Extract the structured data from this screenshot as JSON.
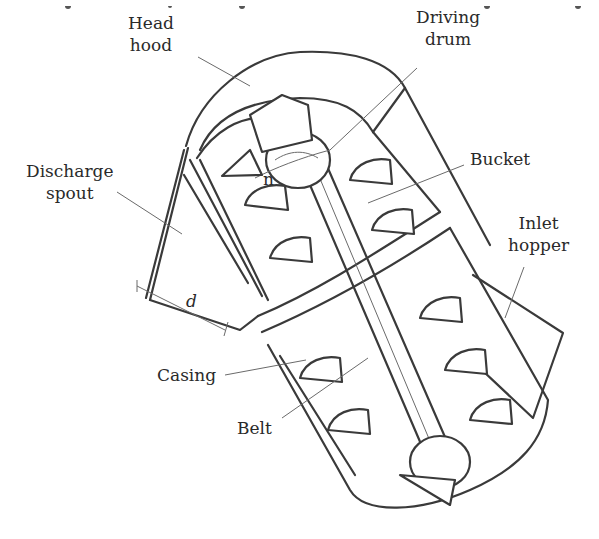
{
  "figure": {
    "labels": {
      "head_hood": [
        "Head",
        "hood"
      ],
      "driving_drum": [
        "Driving",
        "drum"
      ],
      "bucket": [
        "Bucket"
      ],
      "discharge_spout": [
        "Discharge",
        "spout"
      ],
      "inlet_hopper": [
        "Inlet",
        "hopper"
      ],
      "casing": [
        "Casing"
      ],
      "belt": [
        "Belt"
      ]
    },
    "symbols": {
      "rotation": "n",
      "spout_width": "d"
    },
    "colors": {
      "line": "#3a3a3a",
      "leader": "#6a6a6a",
      "text": "#2a2a2a",
      "background": "#ffffff"
    }
  }
}
